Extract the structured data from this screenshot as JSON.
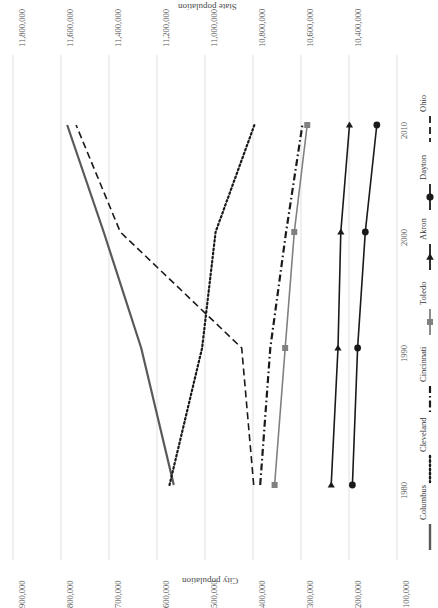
{
  "chart_data": {
    "type": "line",
    "title": "",
    "orientation": "rotated-90",
    "x": [
      1980,
      1990,
      2000,
      2010
    ],
    "xlabel": "",
    "xtick_labels": [
      "1980",
      "1990",
      "2000",
      "2010"
    ],
    "primary_axis": {
      "label": "City population",
      "position": "bottom",
      "ticks": [
        900000,
        800000,
        700000,
        600000,
        500000,
        400000,
        300000,
        200000,
        100000
      ],
      "tick_labels": [
        "900,000",
        "800,000",
        "700,000",
        "600,000",
        "500,000",
        "400,000",
        "300,000",
        "200,000",
        "100,000"
      ],
      "lim": [
        900000,
        100000
      ]
    },
    "secondary_axis": {
      "label": "State population",
      "position": "top",
      "ticks": [
        11800000,
        11600000,
        11400000,
        11200000,
        11000000,
        10800000,
        10600000,
        10400000
      ],
      "tick_labels": [
        "11,800,000",
        "11,600,000",
        "11,400,000",
        "11,200,000",
        "11,000,000",
        "10,800,000",
        "10,600,000",
        "10,400,000"
      ],
      "lim": [
        11800000,
        10400000
      ]
    },
    "grid": true,
    "legend_position": "right",
    "series": [
      {
        "name": "Columbus",
        "axis": "primary",
        "style": "solid",
        "color": "#595959",
        "marker": "none",
        "values": [
          565000,
          633000,
          711000,
          787000
        ]
      },
      {
        "name": "Cleveland",
        "axis": "primary",
        "style": "dotted",
        "color": "#1a1a1a",
        "marker": "none",
        "values": [
          574000,
          506000,
          478000,
          397000
        ]
      },
      {
        "name": "Cincinnati",
        "axis": "primary",
        "style": "dashdot",
        "color": "#1a1a1a",
        "marker": "none",
        "values": [
          385000,
          364000,
          331000,
          297000
        ]
      },
      {
        "name": "Toledo",
        "axis": "primary",
        "style": "solid",
        "color": "#808080",
        "marker": "square",
        "values": [
          355000,
          333000,
          314000,
          287000
        ]
      },
      {
        "name": "Akron",
        "axis": "primary",
        "style": "solid",
        "color": "#1a1a1a",
        "marker": "triangle",
        "values": [
          237000,
          223000,
          217000,
          199000
        ]
      },
      {
        "name": "Dayton",
        "axis": "primary",
        "style": "solid",
        "color": "#1a1a1a",
        "marker": "circle",
        "values": [
          193000,
          182000,
          166000,
          142000
        ]
      },
      {
        "name": "Ohio",
        "axis": "secondary",
        "style": "dashed",
        "color": "#1a1a1a",
        "marker": "none",
        "values": [
          10797000,
          10847000,
          11353000,
          11537000
        ]
      }
    ]
  },
  "legend": {
    "entries": [
      {
        "label": "Columbus"
      },
      {
        "label": "Cleveland"
      },
      {
        "label": "Cincinnati"
      },
      {
        "label": "Toledo"
      },
      {
        "label": "Akron"
      },
      {
        "label": "Dayton"
      },
      {
        "label": "Ohio"
      }
    ]
  }
}
